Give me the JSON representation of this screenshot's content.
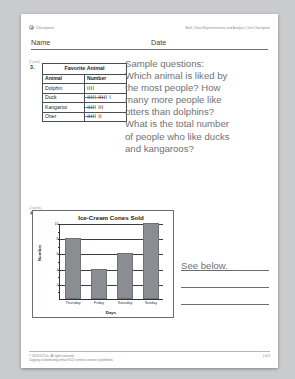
{
  "header": {
    "logo_text": "Checkpoint",
    "breadcrumb": "Math | Data Representations and Analysis | Unit Checkpoint"
  },
  "fields": {
    "name_label": "Name",
    "date_label": "Date"
  },
  "question3": {
    "points": "(1 point)",
    "number": "3.",
    "table": {
      "title": "Favorite Animal",
      "columns": [
        "Animal",
        "Number"
      ],
      "rows": [
        {
          "animal": "Dolphin",
          "tally": "IIII",
          "count": 4
        },
        {
          "animal": "Duck",
          "tally": "̶I̶I̶I̶I̶I ̶I̶I̶I̶I̶I I",
          "count": 11
        },
        {
          "animal": "Kangaroo",
          "tally": "̶I̶I̶I̶I̶I III",
          "count": 8
        },
        {
          "animal": "Otter",
          "tally": "̶I̶I̶I̶I̶I II",
          "count": 7
        }
      ]
    }
  },
  "overlay": {
    "lines": [
      "Sample questions:",
      "Which animal is liked by",
      "the most people? How",
      "many more people like",
      "otters than dolphins?",
      "What is the total number",
      "of people who like ducks",
      "and kangaroos?"
    ]
  },
  "question4": {
    "points": "(2 points)",
    "number": "4.",
    "answer_text": "See below."
  },
  "chart_data": {
    "type": "bar",
    "title": "Ice-Cream Cones Sold",
    "categories": [
      "Thursday",
      "Friday",
      "Saturday",
      "Sunday"
    ],
    "values": [
      8,
      4,
      6,
      10
    ],
    "xlabel": "Days",
    "ylabel": "Number",
    "ylim": [
      0,
      10
    ],
    "yticks": [
      1,
      2,
      3,
      4,
      5,
      6,
      7,
      8,
      9,
      10
    ],
    "grid": true,
    "legend": "none",
    "bar_color": "#8a8d91"
  },
  "footer": {
    "copyright": "© 2013 K12 Inc. All rights reserved.",
    "notice": "Copying or distributing without K12's written consent is prohibited.",
    "page": "2 of 3"
  }
}
